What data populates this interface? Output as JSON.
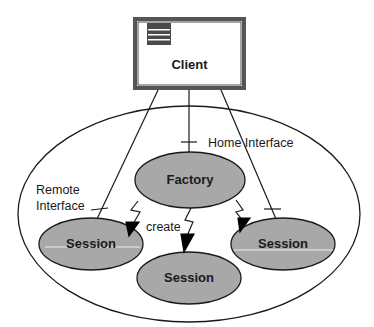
{
  "diagram": {
    "client": {
      "label": "Client"
    },
    "container_labels": {
      "home_interface": "Home Interface",
      "remote_interface_line1": "Remote",
      "remote_interface_line2": "Interface",
      "create": "create"
    },
    "nodes": {
      "factory": "Factory",
      "session_left": "Session",
      "session_bottom": "Session",
      "session_right": "Session"
    },
    "colors": {
      "node_fill": "#a8a8a8",
      "stroke": "#1a1a1a",
      "client_border": "#555555",
      "client_icon": "#4a4a4a",
      "background": "#ffffff"
    }
  }
}
